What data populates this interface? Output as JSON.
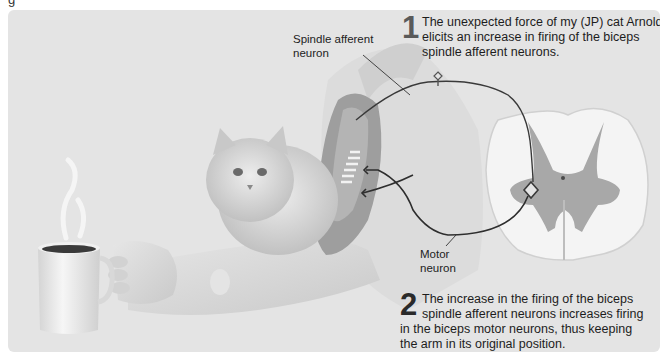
{
  "figure": {
    "fragment_text": "g",
    "labels": {
      "spindle_afferent": [
        "Spindle afferent",
        "neuron"
      ],
      "motor_neuron": [
        "Motor",
        "neuron"
      ]
    },
    "steps": [
      {
        "number": "1",
        "lines": [
          "The unexpected force of my (JP) cat Arnold",
          "elicits an increase in firing of the biceps",
          "spindle afferent neurons."
        ]
      },
      {
        "number": "2",
        "lines": [
          "The increase in the firing of the biceps",
          "spindle afferent neurons increases firing",
          "in the biceps motor neurons, thus keeping",
          "the arm in its original position."
        ]
      }
    ],
    "illustration": {
      "elements": [
        "coffee-mug",
        "steam",
        "hand",
        "forearm",
        "cat",
        "upper-arm",
        "biceps-muscle",
        "muscle-spindle",
        "spinal-cord-cross-section",
        "afferent-neuron-path",
        "motor-neuron-path"
      ]
    },
    "colors": {
      "panel_bg": "#e4e4e4",
      "muscle": "#9a9a9a",
      "spinal_white": "#f4f4f4",
      "spinal_gray": "#a8a8a8",
      "neuron_line": "#3a3a3a"
    }
  }
}
